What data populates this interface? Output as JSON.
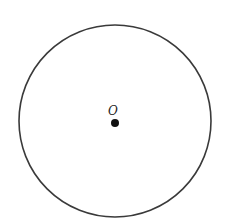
{
  "diagram": {
    "circle": {
      "cx": 115,
      "cy": 121,
      "r": 96,
      "stroke": "#3a3a3a",
      "stroke_width": 1.6
    },
    "center_point": {
      "cx": 115,
      "cy": 123,
      "r": 4,
      "fill": "#111111"
    },
    "center_label": {
      "text": "O",
      "x": 113,
      "y": 115
    }
  }
}
